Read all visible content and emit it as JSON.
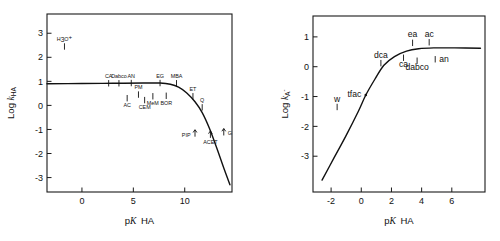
{
  "figure": {
    "background": "#ffffff",
    "ink_color": "#111111",
    "panel_count": 2
  },
  "chart_data": [
    {
      "type": "line",
      "panel": "left",
      "title": "",
      "xlabel": "pK HA",
      "ylabel": "Log k HA",
      "ylabel_parts": {
        "prefix": "Log",
        "symbol": "k",
        "subscript": "HA"
      },
      "xlabel_parts": {
        "prefix": "p",
        "symbol": "K",
        "suffix": "HA"
      },
      "xlim": [
        -3.4,
        14.6
      ],
      "ylim": [
        -3.6,
        3.8
      ],
      "xticks": [
        0,
        5,
        10
      ],
      "yticks": [
        3,
        2,
        1,
        0,
        -1,
        -2,
        -3
      ],
      "grid": false,
      "legend": false,
      "curve_description": "Brønsted plot: plateau near log k = 0.9 from pK -3 to pK 8, curving downward after pK 9 and falling steeply to log k = -3.3 at pK 14",
      "curve_points": [
        {
          "x": -3.4,
          "y": 0.9
        },
        {
          "x": 0.0,
          "y": 0.91
        },
        {
          "x": 3.0,
          "y": 0.92
        },
        {
          "x": 6.0,
          "y": 0.93
        },
        {
          "x": 7.6,
          "y": 0.93
        },
        {
          "x": 8.6,
          "y": 0.88
        },
        {
          "x": 9.4,
          "y": 0.76
        },
        {
          "x": 10.2,
          "y": 0.52
        },
        {
          "x": 11.0,
          "y": 0.15
        },
        {
          "x": 11.7,
          "y": -0.3
        },
        {
          "x": 12.4,
          "y": -0.95
        },
        {
          "x": 13.1,
          "y": -1.75
        },
        {
          "x": 13.8,
          "y": -2.6
        },
        {
          "x": 14.4,
          "y": -3.3
        }
      ],
      "points": [
        {
          "label": "H3O+",
          "label_html": "H₃O⁺",
          "x": -1.7,
          "y": 2.45,
          "label_pos": "above",
          "marker": "stem"
        },
        {
          "label": "CA",
          "x": 2.6,
          "y": 0.92,
          "label_pos": "above",
          "marker": "stem"
        },
        {
          "label": "Dabco",
          "x": 3.6,
          "y": 0.92,
          "label_pos": "above",
          "marker": "stem"
        },
        {
          "label": "AN",
          "x": 4.8,
          "y": 0.93,
          "label_pos": "above",
          "marker": "stem"
        },
        {
          "label": "AC",
          "x": 4.4,
          "y": 0.3,
          "label_pos": "below",
          "marker": "stem"
        },
        {
          "label": "PM",
          "x": 5.5,
          "y": 0.45,
          "label_pos": "above",
          "marker": "stem"
        },
        {
          "label": "CEM",
          "x": 6.1,
          "y": 0.22,
          "label_pos": "below",
          "marker": "stem"
        },
        {
          "label": "MeM",
          "x": 6.9,
          "y": 0.38,
          "label_pos": "below",
          "marker": "stem"
        },
        {
          "label": "EG",
          "x": 7.6,
          "y": 0.93,
          "label_pos": "above",
          "marker": "stem"
        },
        {
          "label": "BOR",
          "x": 8.2,
          "y": 0.4,
          "label_pos": "below",
          "marker": "stem"
        },
        {
          "label": "MBA",
          "x": 9.2,
          "y": 0.92,
          "label_pos": "above",
          "marker": "stem"
        },
        {
          "label": "ET",
          "x": 10.8,
          "y": 0.38,
          "label_pos": "above",
          "marker": "stem"
        },
        {
          "label": "Q",
          "x": 11.7,
          "y": -0.08,
          "label_pos": "above",
          "marker": "stem"
        },
        {
          "label": "PIP",
          "x": 11.0,
          "y": -1.2,
          "label_pos": "left",
          "marker": "arrow-up"
        },
        {
          "label": "ACET",
          "x": 12.5,
          "y": -1.25,
          "label_pos": "below",
          "marker": "arrow-up"
        },
        {
          "label": "G",
          "x": 13.8,
          "y": -1.15,
          "label_pos": "right",
          "marker": "arrow-up"
        }
      ]
    },
    {
      "type": "line",
      "panel": "right",
      "title": "",
      "xlabel": "pK HA",
      "ylabel": "Log k A-",
      "ylabel_parts": {
        "prefix": "Log",
        "symbol": "k",
        "subscript": "A",
        "superscript": "-"
      },
      "xlabel_parts": {
        "prefix": "p",
        "symbol": "K",
        "suffix": "HA"
      },
      "xlim": [
        -3.2,
        8.2
      ],
      "ylim": [
        -4.2,
        1.7
      ],
      "xticks": [
        -2,
        0,
        2,
        4,
        6
      ],
      "yticks": [
        1,
        0,
        -1,
        -2,
        -3
      ],
      "grid": false,
      "legend": false,
      "curve_description": "Brønsted plot: rising steeply from log k = -3.8 at pK -2.6, curving through log k = -0.9 at pK 0.3, flattening to a plateau near log k = 0.62 above pK 4",
      "curve_points": [
        {
          "x": -2.6,
          "y": -3.8
        },
        {
          "x": -1.8,
          "y": -3.05
        },
        {
          "x": -1.0,
          "y": -2.3
        },
        {
          "x": -0.2,
          "y": -1.5
        },
        {
          "x": 0.3,
          "y": -0.95
        },
        {
          "x": 0.9,
          "y": -0.42
        },
        {
          "x": 1.5,
          "y": 0.05
        },
        {
          "x": 2.2,
          "y": 0.34
        },
        {
          "x": 3.0,
          "y": 0.52
        },
        {
          "x": 3.8,
          "y": 0.6
        },
        {
          "x": 4.8,
          "y": 0.63
        },
        {
          "x": 6.2,
          "y": 0.63
        },
        {
          "x": 7.9,
          "y": 0.62
        }
      ],
      "points": [
        {
          "label": "w",
          "x": -1.6,
          "y": -1.35,
          "label_pos": "above",
          "marker": "stem"
        },
        {
          "label": "tfac",
          "x": 0.3,
          "y": -0.95,
          "label_pos": "left",
          "marker": "point"
        },
        {
          "label": "dca",
          "x": 1.3,
          "y": 0.12,
          "label_pos": "above",
          "marker": "stem"
        },
        {
          "label": "ca",
          "x": 2.8,
          "y": 0.3,
          "label_pos": "below",
          "marker": "stem"
        },
        {
          "label": "ea",
          "x": 3.4,
          "y": 0.8,
          "label_pos": "above",
          "marker": "stem"
        },
        {
          "label": "dabco",
          "x": 3.7,
          "y": 0.2,
          "label_pos": "below",
          "marker": "stem"
        },
        {
          "label": "ac",
          "x": 4.5,
          "y": 0.82,
          "label_pos": "above",
          "marker": "stem"
        },
        {
          "label": "an",
          "x": 4.9,
          "y": 0.25,
          "label_pos": "right",
          "marker": "stem"
        }
      ]
    }
  ],
  "left_panel": {
    "axis_title_x_prefix": "p",
    "axis_title_x_symbol": "K",
    "axis_title_x_suffix": "HA",
    "axis_title_y_prefix": "Log",
    "axis_title_y_symbol": "k",
    "axis_title_y_sub": "HA",
    "xticklabels": [
      "0",
      "5",
      "10"
    ],
    "yticklabels": [
      "3",
      "2",
      "1",
      "0",
      "-1",
      "-2",
      "-3"
    ]
  },
  "right_panel": {
    "axis_title_x_prefix": "p",
    "axis_title_x_symbol": "K",
    "axis_title_x_suffix": "HA",
    "axis_title_y_prefix": "Log",
    "axis_title_y_symbol": "k",
    "axis_title_y_sub": "A",
    "axis_title_y_sup": "-",
    "xticklabels": [
      "-2",
      "0",
      "2",
      "4",
      "6"
    ],
    "yticklabels": [
      "1",
      "0",
      "-1",
      "-2",
      "-3"
    ]
  }
}
